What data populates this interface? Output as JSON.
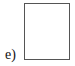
{
  "figure": {
    "label": "e)",
    "shape": "rectangle",
    "border_color": "#555555",
    "fill_color": "#ffffff"
  }
}
